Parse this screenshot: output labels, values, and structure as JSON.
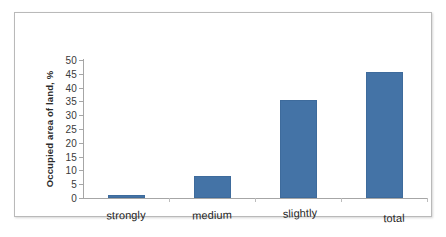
{
  "chart_data": {
    "type": "bar",
    "title": "",
    "subtitle": "",
    "xlabel": "",
    "ylabel": "Occupied area of land, %",
    "categories": [
      "strongly",
      "medium",
      "slightly",
      "total"
    ],
    "values": [
      1,
      8,
      35.5,
      45.5
    ],
    "series": [
      {
        "name": "Occupied area of land, %",
        "values": [
          1,
          8,
          35.5,
          45.5
        ],
        "color": "#4473a6"
      }
    ],
    "ylim": [
      0,
      50
    ],
    "y_tick_step": 5,
    "y_tick_labels": [
      "50",
      "45",
      "40",
      "35",
      "30",
      "25",
      "20",
      "15",
      "10",
      "5",
      "0"
    ],
    "grid": false,
    "legend": false,
    "legend_position": "none",
    "axis_color": "#a6a6a6",
    "bar_color": "#4473a6",
    "frame_color": "#b9b9b9"
  }
}
